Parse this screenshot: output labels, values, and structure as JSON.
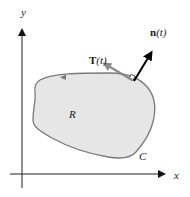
{
  "diagram": {
    "axes": {
      "x_label": "x",
      "y_label": "y"
    },
    "region": {
      "label": "R",
      "fill": "#e6e6e6",
      "stroke": "#7a7a7a"
    },
    "curve": {
      "label": "C",
      "orientation": "counterclockwise"
    },
    "tangent_vector": {
      "label_bold": "T",
      "label_arg": "(t)",
      "color": "#8a8a8a"
    },
    "normal_vector": {
      "label_bold": "n",
      "label_arg": "(t)",
      "color": "#000000"
    }
  }
}
